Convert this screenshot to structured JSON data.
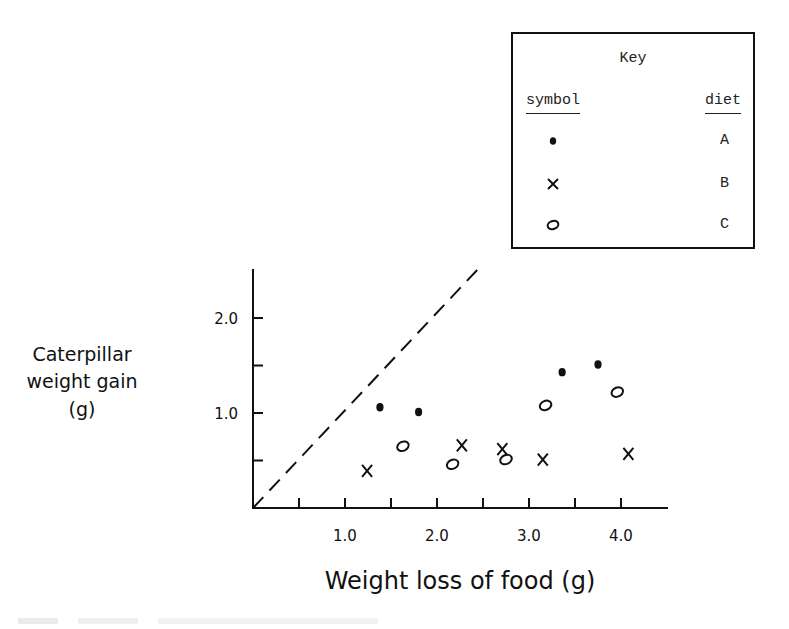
{
  "chart_data": {
    "type": "scatter",
    "title": "",
    "xlabel": "Weight loss of food (g)",
    "ylabel_lines": [
      "Caterpillar",
      "weight gain",
      "(g)"
    ],
    "ylabel": "Caterpillar weight gain (g)",
    "xlim": [
      0,
      4.5
    ],
    "ylim": [
      0,
      2.5
    ],
    "x_ticks": [
      0.5,
      1.0,
      1.5,
      2.0,
      2.5,
      3.0,
      3.5,
      4.0
    ],
    "x_tick_labels": [
      "1.0",
      "2.0",
      "3.0",
      "4.0"
    ],
    "y_ticks": [
      0.5,
      1.0,
      1.5,
      2.0
    ],
    "y_tick_labels": [
      "1.0",
      "2.0"
    ],
    "grid": false,
    "reference_line": {
      "style": "dashed",
      "equation": "y = x"
    },
    "legend": {
      "title": "Key",
      "col_headers": [
        "symbol",
        "diet"
      ],
      "entries": [
        {
          "symbol": "filled-dot",
          "diet": "A"
        },
        {
          "symbol": "cross",
          "diet": "B"
        },
        {
          "symbol": "open-circle",
          "diet": "C"
        }
      ],
      "position": "upper right"
    },
    "series": [
      {
        "name": "A",
        "marker": "filled-dot",
        "points": [
          [
            1.38,
            1.06
          ],
          [
            1.8,
            1.01
          ],
          [
            3.36,
            1.43
          ],
          [
            3.75,
            1.51
          ]
        ]
      },
      {
        "name": "B",
        "marker": "cross",
        "points": [
          [
            1.24,
            0.39
          ],
          [
            2.27,
            0.66
          ],
          [
            2.71,
            0.62
          ],
          [
            3.15,
            0.51
          ],
          [
            4.08,
            0.57
          ]
        ]
      },
      {
        "name": "C",
        "marker": "open-circle",
        "points": [
          [
            1.63,
            0.65
          ],
          [
            2.17,
            0.46
          ],
          [
            2.75,
            0.51
          ],
          [
            3.18,
            1.08
          ],
          [
            3.96,
            1.22
          ]
        ]
      }
    ]
  }
}
